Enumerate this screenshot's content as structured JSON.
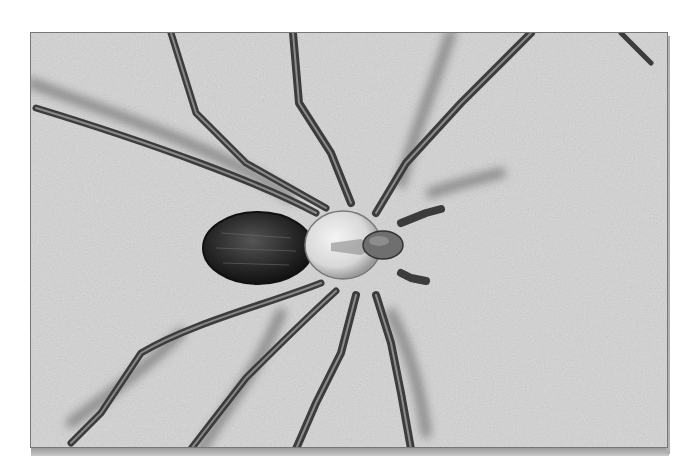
{
  "image": {
    "subject": "brown recluse spider",
    "style": "grayscale photograph",
    "colors": {
      "background": "#d6d6d6",
      "abdomen": "#2a2a2a",
      "cephalothorax": "#e8e8e8",
      "legs": "#3a3a3a",
      "shadow": "#5a5a5a"
    }
  }
}
